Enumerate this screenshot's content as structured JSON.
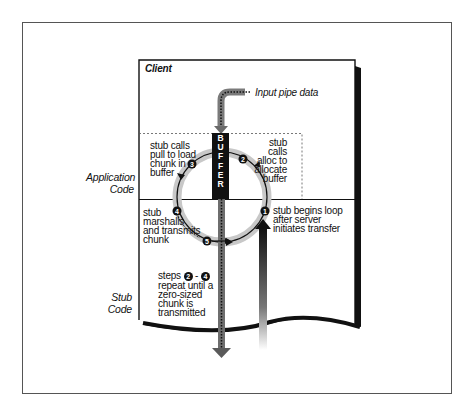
{
  "diagram": {
    "title": "Client",
    "input_label": "Input pipe data",
    "buffer_label": "BUFFER",
    "buffer_letters": [
      "B",
      "U",
      "F",
      "F",
      "E",
      "R"
    ],
    "regions": {
      "application": {
        "line1": "Application",
        "line2": "Code"
      },
      "stub": {
        "line1": "Stub",
        "line2": "Code"
      }
    },
    "steps": [
      {
        "number": "1",
        "lines": [
          "stub begins loop",
          "after server",
          "initiates transfer"
        ]
      },
      {
        "number": "2",
        "lines": [
          "stub calls",
          "alloc to",
          "allocate",
          "buffer"
        ]
      },
      {
        "number": "3",
        "lines": [
          "stub calls",
          "pull to load",
          "chunk in",
          "buffer"
        ]
      },
      {
        "number": "4",
        "lines": [
          "stub",
          "marshalls",
          "and transmits",
          "chunk"
        ]
      },
      {
        "number": "5",
        "lines": []
      }
    ],
    "repeat_note": {
      "prefix": "steps",
      "from": "2",
      "dash": "-",
      "to": "4",
      "lines": [
        "repeat until a",
        "zero-sized",
        "chunk is",
        "transmitted"
      ]
    },
    "colors": {
      "ink": "#111111",
      "ring": "#c8c8c8",
      "pipe": "#6e6e6e",
      "background": "#ffffff"
    }
  }
}
